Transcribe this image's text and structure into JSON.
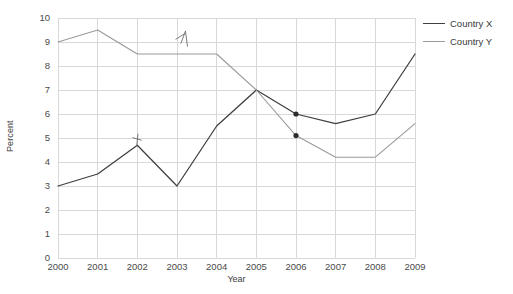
{
  "chart_data": {
    "type": "line",
    "title": "",
    "xlabel": "Year",
    "ylabel": "Percent",
    "x": [
      2000,
      2001,
      2002,
      2003,
      2004,
      2005,
      2006,
      2007,
      2008,
      2009
    ],
    "xtick_labels": [
      "2000",
      "2001",
      "2002",
      "2003",
      "2004",
      "2005",
      "2006",
      "2007",
      "2008",
      "2009"
    ],
    "ytick_labels": [
      "10",
      "9",
      "8",
      "7",
      "6",
      "5",
      "4",
      "3",
      "2",
      "1",
      "0"
    ],
    "xlim": [
      2000,
      2009
    ],
    "ylim": [
      0,
      10
    ],
    "ytick_step": 1,
    "grid": true,
    "legend_position": "right",
    "series": [
      {
        "name": "Country X",
        "color": "#3f3f3f",
        "values": [
          3.0,
          3.5,
          4.7,
          3.0,
          5.5,
          7.0,
          6.0,
          5.6,
          6.0,
          8.5
        ]
      },
      {
        "name": "Country Y",
        "color": "#9a9a9a",
        "values": [
          9.0,
          9.5,
          8.5,
          8.5,
          8.5,
          7.0,
          5.1,
          4.2,
          4.2,
          5.6
        ]
      }
    ],
    "annotations": [
      {
        "name": "pen-mark-2002",
        "kind": "handwritten-tick",
        "x": 2002,
        "y": 4.95
      },
      {
        "name": "pen-mark-2003",
        "kind": "handwritten-slash",
        "x": 2003.15,
        "y": 9.2
      },
      {
        "name": "dot-marker-country-x-2006",
        "kind": "dot",
        "x": 2006,
        "y": 6.0,
        "color": "#2d2d2d"
      },
      {
        "name": "dot-marker-country-y-2006",
        "kind": "dot",
        "x": 2006,
        "y": 5.1,
        "color": "#2d2d2d"
      }
    ],
    "colors": {
      "grid": "#d9d9d9",
      "axis": "#c4c4c4",
      "text": "#3d3d3d",
      "country_x": "#3f3f3f",
      "country_y": "#9a9a9a"
    }
  }
}
